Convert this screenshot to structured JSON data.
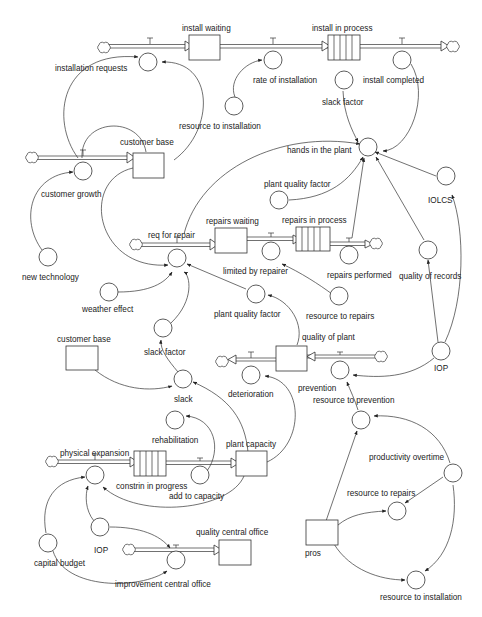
{
  "diagram": {
    "type": "stock-and-flow",
    "colors": {
      "line": "#333333",
      "background": "#ffffff",
      "text": "#222222"
    },
    "stocks": [
      {
        "id": "install_waiting",
        "label": "install waiting"
      },
      {
        "id": "install_in_process",
        "label": "install in process",
        "conveyor": true
      },
      {
        "id": "customer_base",
        "label": "customer base"
      },
      {
        "id": "repairs_waiting",
        "label": "repairs waiting"
      },
      {
        "id": "repairs_in_process",
        "label": "repairs in process",
        "conveyor": true
      },
      {
        "id": "customer_base_2",
        "label": "customer base"
      },
      {
        "id": "quality_of_plant",
        "label": "quality of plant"
      },
      {
        "id": "constrin_in_progress",
        "label": "constrin in progress",
        "conveyor": true
      },
      {
        "id": "plant_capacity",
        "label": "plant capacity"
      },
      {
        "id": "quality_central_office",
        "label": "quality central office"
      },
      {
        "id": "pros",
        "label": "pros"
      }
    ],
    "flows": [
      {
        "id": "installation_requests",
        "label": "installation requests"
      },
      {
        "id": "rate_of_installation",
        "label": "rate of installation"
      },
      {
        "id": "install_completed",
        "label": "install completed"
      },
      {
        "id": "customer_growth",
        "label": "customer growth"
      },
      {
        "id": "req_for_repair",
        "label": "req for repair"
      },
      {
        "id": "limited_by_repairer",
        "label": "limited by repairer"
      },
      {
        "id": "repairs_performed",
        "label": "repairs performed"
      },
      {
        "id": "deterioration",
        "label": "deterioration"
      },
      {
        "id": "prevention",
        "label": "prevention"
      },
      {
        "id": "physical_expansion",
        "label": "physical expansion"
      },
      {
        "id": "add_to_capacity",
        "label": "add to capacity"
      },
      {
        "id": "improvement_central_office",
        "label": "improvement central office"
      }
    ],
    "auxiliaries": [
      {
        "id": "resource_to_installation",
        "label": "resource to installation"
      },
      {
        "id": "slack_factor_top",
        "label": "slack factor"
      },
      {
        "id": "hands_in_the_plant",
        "label": "hands in the plant"
      },
      {
        "id": "plant_quality_factor_top",
        "label": "plant quality factor"
      },
      {
        "id": "IOLCS",
        "label": "IOLCS"
      },
      {
        "id": "new_technology",
        "label": "new technology"
      },
      {
        "id": "quality_of_records",
        "label": "quality of records"
      },
      {
        "id": "weather_effect",
        "label": "weather effect"
      },
      {
        "id": "plant_quality_factor",
        "label": "plant quality factor"
      },
      {
        "id": "resource_to_repairs_top",
        "label": "resource to repairs"
      },
      {
        "id": "slack_factor",
        "label": "slack factor"
      },
      {
        "id": "IOP_right",
        "label": "IOP"
      },
      {
        "id": "slack",
        "label": "slack"
      },
      {
        "id": "resource_to_prevention",
        "label": "resource to prevention"
      },
      {
        "id": "rehabilitation",
        "label": "rehabilitation"
      },
      {
        "id": "productivity_overtime",
        "label": "productivity overtime"
      },
      {
        "id": "resource_to_repairs",
        "label": "resource to repairs"
      },
      {
        "id": "IOP_left",
        "label": "IOP"
      },
      {
        "id": "capital_budget",
        "label": "capital budget"
      },
      {
        "id": "resource_to_installation_bottom",
        "label": "resource to installation"
      }
    ]
  }
}
